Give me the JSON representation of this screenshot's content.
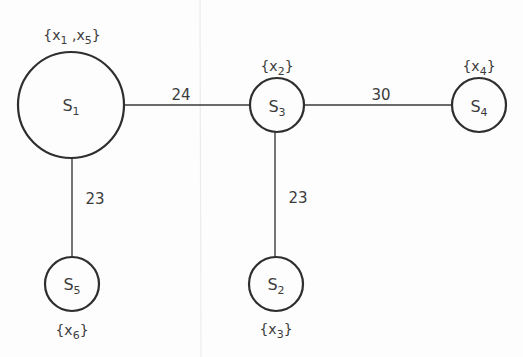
{
  "diagram": {
    "type": "weighted tree graph",
    "nodes": [
      {
        "id": "S1",
        "base": "S",
        "sub": "1",
        "set_items": [
          {
            "b": "x",
            "s": "1"
          },
          {
            "b": "x",
            "s": "5"
          }
        ],
        "set_label": "{x1,x5}",
        "cx": 71,
        "cy": 105,
        "r": 53
      },
      {
        "id": "S3",
        "base": "S",
        "sub": "3",
        "set_items": [
          {
            "b": "x",
            "s": "2"
          }
        ],
        "set_label": "{x2}",
        "cx": 277,
        "cy": 105,
        "r": 27
      },
      {
        "id": "S4",
        "base": "S",
        "sub": "4",
        "set_items": [
          {
            "b": "x",
            "s": "4"
          }
        ],
        "set_label": "{x4}",
        "cx": 479,
        "cy": 105,
        "r": 27
      },
      {
        "id": "S5",
        "base": "S",
        "sub": "5",
        "set_items": [
          {
            "b": "x",
            "s": "6"
          }
        ],
        "set_label": "{x6}",
        "cx": 72,
        "cy": 284,
        "r": 27
      },
      {
        "id": "S2",
        "base": "S",
        "sub": "2",
        "set_items": [
          {
            "b": "x",
            "s": "3"
          }
        ],
        "set_label": "{x3}",
        "cx": 276,
        "cy": 284,
        "r": 27
      }
    ],
    "edges": [
      {
        "from": "S1",
        "to": "S3",
        "weight": "24"
      },
      {
        "from": "S3",
        "to": "S4",
        "weight": "30"
      },
      {
        "from": "S1",
        "to": "S5",
        "weight": "23"
      },
      {
        "from": "S3",
        "to": "S2",
        "weight": "23"
      }
    ]
  }
}
